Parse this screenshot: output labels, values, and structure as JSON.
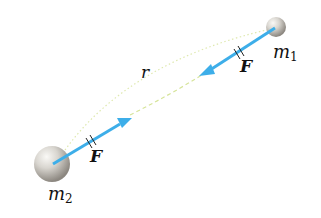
{
  "diagram": {
    "colors": {
      "force_arrow": "#3daee9",
      "distance_curve": "#d9e6a0",
      "sphere_light": "#f2f0ec",
      "sphere_dark": "#8c8780",
      "text": "#111111"
    },
    "masses": [
      {
        "id": "m1",
        "label": "m",
        "subscript": "1"
      },
      {
        "id": "m2",
        "label": "m",
        "subscript": "2"
      }
    ],
    "forces": [
      {
        "on": "m1",
        "label": "F",
        "direction": "toward m2"
      },
      {
        "on": "m2",
        "label": "F",
        "direction": "toward m1"
      }
    ],
    "distance": {
      "label": "r"
    }
  }
}
